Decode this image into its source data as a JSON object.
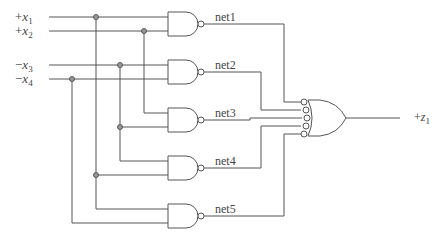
{
  "diagram": {
    "type": "logic-circuit",
    "inputs": [
      {
        "id": "x1",
        "sign": "+",
        "var": "x",
        "sub": "1",
        "y": 17
      },
      {
        "id": "x2",
        "sign": "+",
        "var": "x",
        "sub": "2",
        "y": 31
      },
      {
        "id": "x3",
        "sign": "−",
        "var": "x",
        "sub": "3",
        "y": 65
      },
      {
        "id": "x4",
        "sign": "−",
        "var": "x",
        "sub": "4",
        "y": 79
      }
    ],
    "nand_gates": [
      {
        "id": "g1",
        "net": "net1",
        "inputs": [
          "x1",
          "x2"
        ]
      },
      {
        "id": "g2",
        "net": "net2",
        "inputs": [
          "x3",
          "x4"
        ]
      },
      {
        "id": "g3",
        "net": "net3",
        "inputs": [
          "x2",
          "x3"
        ]
      },
      {
        "id": "g4",
        "net": "net4",
        "inputs": [
          "x3",
          "x1"
        ]
      },
      {
        "id": "g5",
        "net": "net5",
        "inputs": [
          "x1",
          "x4"
        ]
      }
    ],
    "output_gate": {
      "type": "OR with inverted inputs (NAND)",
      "inputs": [
        "net1",
        "net2",
        "net3",
        "net4",
        "net5"
      ]
    },
    "output": {
      "sign": "+",
      "var": "z",
      "sub": "1"
    },
    "labels": {
      "net1": "net1",
      "net2": "net2",
      "net3": "net3",
      "net4": "net4",
      "net5": "net5"
    },
    "colors": {
      "wire": "#555555",
      "dot": "#999999",
      "text": "#444444"
    }
  }
}
